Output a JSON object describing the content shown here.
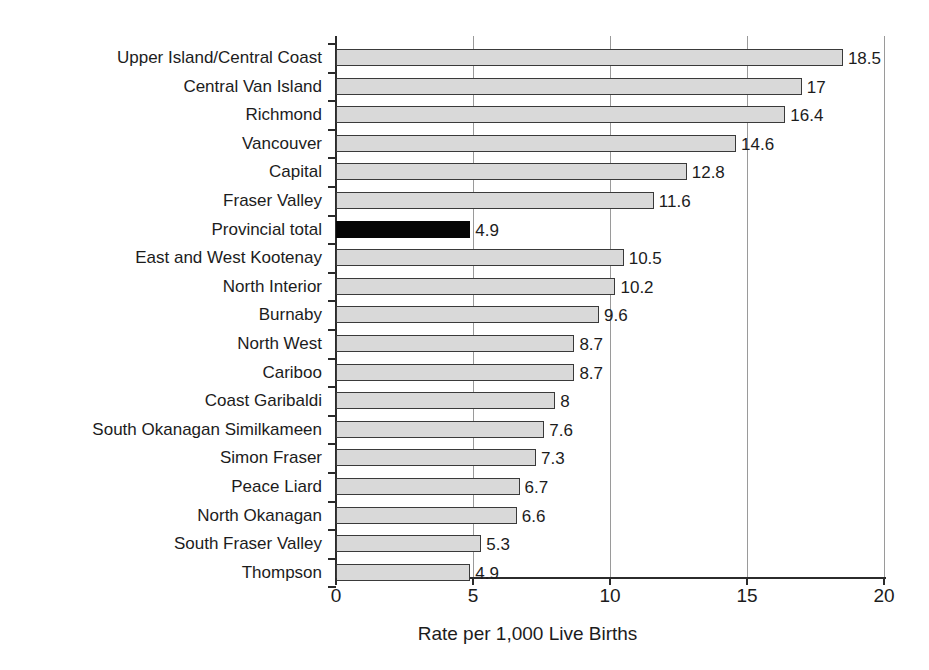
{
  "chart_data": {
    "type": "bar",
    "orientation": "horizontal",
    "title": "",
    "subtitle": "",
    "xlabel": "Rate per 1,000 Live Births",
    "ylabel": "",
    "xlim": [
      0,
      20
    ],
    "xticks": [
      "0",
      "5",
      "10",
      "15",
      "20"
    ],
    "xtick_values": [
      0,
      5,
      10,
      15,
      20
    ],
    "grid": "vertical",
    "legend": "none",
    "categories": [
      "Upper Island/Central Coast",
      "Central Van Island",
      "Richmond",
      "Vancouver",
      "Capital",
      "Fraser Valley",
      "Provincial total",
      "East and West Kootenay",
      "North Interior",
      "Burnaby",
      "North West",
      "Cariboo",
      "Coast Garibaldi",
      "South Okanagan Similkameen",
      "Simon Fraser",
      "Peace Liard",
      "North Okanagan",
      "South Fraser Valley",
      "Thompson"
    ],
    "values": [
      18.5,
      17,
      16.4,
      14.6,
      12.8,
      11.6,
      4.9,
      10.5,
      10.2,
      9.6,
      8.7,
      8.7,
      8,
      7.6,
      7.3,
      6.7,
      6.6,
      5.3,
      4.9
    ],
    "value_labels": [
      "18.5",
      "17",
      "16.4",
      "14.6",
      "12.8",
      "11.6",
      "4.9",
      "10.5",
      "10.2",
      "9.6",
      "8.7",
      "8.7",
      "8",
      "7.6",
      "7.3",
      "6.7",
      "6.6",
      "5.3",
      "4.9"
    ],
    "highlight_index": 6,
    "colors": {
      "bar_fill": "#d9d9d9",
      "bar_border": "#3a3a3a",
      "highlight_fill": "#050505",
      "axis": "#2b2b2b",
      "grid": "#9a9a9a",
      "text": "#1c1c1c",
      "background": "#ffffff"
    }
  }
}
